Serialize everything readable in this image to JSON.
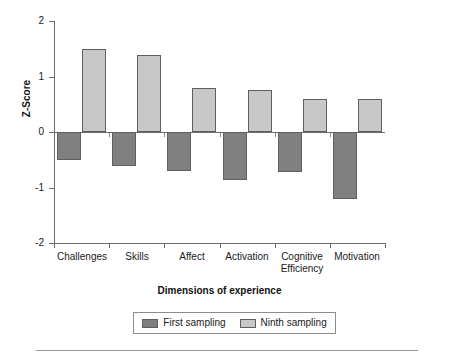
{
  "chart_data": {
    "type": "bar",
    "title": "",
    "xlabel": "Dimensions of experience",
    "ylabel": "Z-Score",
    "ylim": [
      -2,
      2
    ],
    "yticks": [
      "2",
      "1",
      "0",
      "-1",
      "-2"
    ],
    "ytick_values": [
      2,
      1,
      0,
      -1,
      -2
    ],
    "grid": false,
    "legend_position": "bottom",
    "categories": [
      "Challenges",
      "Skills",
      "Affect",
      "Activation",
      "Cognitive\nEfficiency",
      "Motivation"
    ],
    "series": [
      {
        "name": "First sampling",
        "color": "#808080",
        "values": [
          -0.5,
          -0.61,
          -0.7,
          -0.86,
          -0.72,
          -1.21
        ]
      },
      {
        "name": "Ninth sampling",
        "color": "#c8c8c8",
        "values": [
          1.5,
          1.39,
          0.79,
          0.75,
          0.6,
          0.6
        ]
      }
    ]
  },
  "legend": {
    "entries": [
      {
        "label": "First sampling",
        "swatch": "#808080"
      },
      {
        "label": "Ninth sampling",
        "swatch": "#c8c8c8"
      }
    ]
  },
  "colors": {
    "first_sampling": "#808080",
    "ninth_sampling": "#c8c8c8",
    "axis": "#6b6b6b",
    "bar_border": "#5f5f5f",
    "text": "#1a1a1a"
  }
}
